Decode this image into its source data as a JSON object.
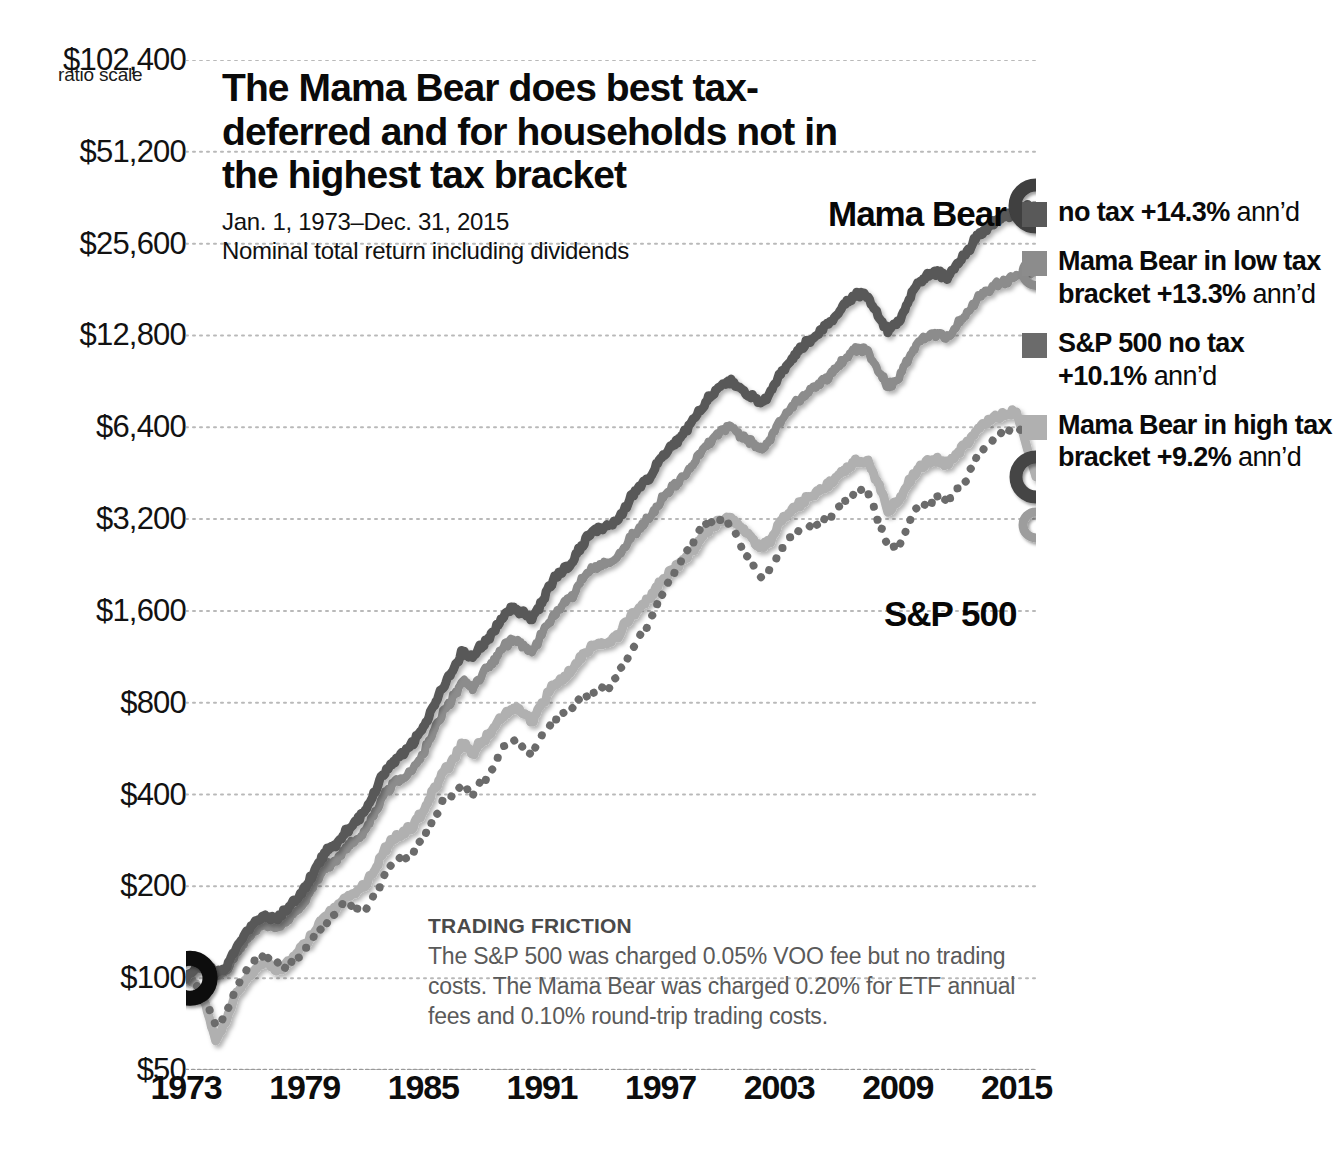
{
  "header": {
    "title": "The Mama Bear does best tax-deferred and for households not in the highest tax bracket",
    "date_range": "Jan. 1, 1973–Dec. 31, 2015",
    "subnote": "Nominal total return including dividends",
    "ratio_scale_label": "ratio scale"
  },
  "inline_labels": {
    "mama_bear": "Mama Bear",
    "sp500": "S&P 500"
  },
  "legend": [
    {
      "name": "no tax",
      "perf": "+14.3%",
      "annd": "ann’d",
      "color": "#595959"
    },
    {
      "name": "Mama Bear in low tax bracket",
      "perf": "+13.3%",
      "annd": "ann’d",
      "color": "#8c8c8c"
    },
    {
      "name": "S&P 500 no tax",
      "perf": "+10.1%",
      "annd": "ann’d",
      "color": "#6b6b6b"
    },
    {
      "name": "Mama Bear in high tax bracket",
      "perf": "+9.2%",
      "annd": "ann’d",
      "color": "#b0b0b0"
    }
  ],
  "trading_friction": {
    "heading": "TRADING FRICTION",
    "body": "The S&P 500 was charged 0.05% VOO fee but no trading costs. The Mama Bear was charged 0.20% for ETF annual fees and 0.10% round-trip trading costs."
  },
  "chart_data": {
    "type": "line",
    "title": "The Mama Bear does best tax-deferred and for households not in the highest tax bracket",
    "subtitle": "Jan. 1, 1973–Dec. 31, 2015 / Nominal total return including dividends",
    "xlabel": "",
    "ylabel": "ratio scale",
    "scale": "log2",
    "grid": true,
    "legend_position": "right",
    "xlim": [
      1973,
      2015.99
    ],
    "ylim": [
      50,
      102400
    ],
    "yticks": [
      102400,
      51200,
      25600,
      12800,
      6400,
      3200,
      1600,
      800,
      400,
      200,
      100,
      50
    ],
    "ytick_labels": [
      "$102,400",
      "$51,200",
      "$25,600",
      "$12,800",
      "$6,400",
      "$3,200",
      "$1,600",
      "$800",
      "$400",
      "$200",
      "$100",
      "$50"
    ],
    "xticks": [
      1973,
      1979,
      1985,
      1991,
      1997,
      2003,
      2009,
      2015
    ],
    "xtick_labels": [
      "1973",
      "1979",
      "1985",
      "1991",
      "1997",
      "2003",
      "2009",
      "2015"
    ],
    "annotations": [
      {
        "text": "Mama Bear",
        "x": 2008,
        "y": 60000
      },
      {
        "text": "S&P 500",
        "x": 2007.5,
        "y": 2100
      }
    ],
    "start_marker": {
      "x": 1973,
      "y": 100,
      "style": "black-ring"
    },
    "series": [
      {
        "name": "Mama Bear no tax",
        "annualized": 14.3,
        "color": "#595959",
        "style": "solid",
        "width": 9,
        "end_marker": "dark-ring-large",
        "x": [
          1973,
          1973.5,
          1974,
          1974.5,
          1975,
          1975.5,
          1976,
          1976.5,
          1977,
          1977.5,
          1978,
          1978.5,
          1979,
          1979.5,
          1980,
          1980.5,
          1981,
          1981.5,
          1982,
          1982.5,
          1983,
          1983.5,
          1984,
          1984.5,
          1985,
          1985.5,
          1986,
          1986.5,
          1987,
          1987.5,
          1988,
          1988.5,
          1989,
          1989.5,
          1990,
          1990.5,
          1991,
          1991.5,
          1992,
          1992.5,
          1993,
          1993.5,
          1994,
          1994.5,
          1995,
          1995.5,
          1996,
          1996.5,
          1997,
          1997.5,
          1998,
          1998.5,
          1999,
          1999.5,
          2000,
          2000.5,
          2001,
          2001.5,
          2002,
          2002.5,
          2003,
          2003.5,
          2004,
          2004.5,
          2005,
          2005.5,
          2006,
          2006.5,
          2007,
          2007.5,
          2008,
          2008.5,
          2009,
          2009.5,
          2010,
          2010.5,
          2011,
          2011.5,
          2012,
          2012.5,
          2013,
          2013.5,
          2014,
          2014.5,
          2015,
          2015.99
        ],
        "y": [
          100,
          108,
          112,
          104,
          108,
          124,
          140,
          152,
          160,
          156,
          165,
          178,
          196,
          225,
          258,
          272,
          300,
          322,
          348,
          400,
          470,
          512,
          540,
          590,
          660,
          780,
          900,
          1020,
          1180,
          1120,
          1240,
          1360,
          1520,
          1640,
          1580,
          1500,
          1720,
          1980,
          2160,
          2320,
          2620,
          2900,
          2980,
          3050,
          3300,
          3750,
          4100,
          4450,
          5000,
          5500,
          5900,
          6500,
          7300,
          8000,
          8700,
          9100,
          8600,
          8200,
          7700,
          8200,
          9600,
          10500,
          11500,
          12200,
          13000,
          13900,
          15200,
          16500,
          17600,
          17200,
          15000,
          13200,
          14000,
          16500,
          18800,
          20000,
          20500,
          19800,
          22000,
          24000,
          27000,
          29000,
          30500,
          31500,
          33000,
          34000
        ]
      },
      {
        "name": "Mama Bear in low tax bracket",
        "annualized": 13.3,
        "color": "#8c8c8c",
        "style": "solid",
        "width": 8,
        "end_marker": "gray-ring-small",
        "x": [
          1973,
          1973.5,
          1974,
          1974.5,
          1975,
          1975.5,
          1976,
          1976.5,
          1977,
          1977.5,
          1978,
          1978.5,
          1979,
          1979.5,
          1980,
          1980.5,
          1981,
          1981.5,
          1982,
          1982.5,
          1983,
          1983.5,
          1984,
          1984.5,
          1985,
          1985.5,
          1986,
          1986.5,
          1987,
          1987.5,
          1988,
          1988.5,
          1989,
          1989.5,
          1990,
          1990.5,
          1991,
          1991.5,
          1992,
          1992.5,
          1993,
          1993.5,
          1994,
          1994.5,
          1995,
          1995.5,
          1996,
          1996.5,
          1997,
          1997.5,
          1998,
          1998.5,
          1999,
          1999.5,
          2000,
          2000.5,
          2001,
          2001.5,
          2002,
          2002.5,
          2003,
          2003.5,
          2004,
          2004.5,
          2005,
          2005.5,
          2006,
          2006.5,
          2007,
          2007.5,
          2008,
          2008.5,
          2009,
          2009.5,
          2010,
          2010.5,
          2011,
          2011.5,
          2012,
          2012.5,
          2013,
          2013.5,
          2014,
          2014.5,
          2015,
          2015.99
        ],
        "y": [
          100,
          107,
          110,
          102,
          105,
          119,
          133,
          143,
          150,
          145,
          152,
          163,
          178,
          203,
          230,
          241,
          263,
          280,
          300,
          342,
          398,
          431,
          452,
          490,
          545,
          640,
          735,
          828,
          952,
          900,
          990,
          1080,
          1200,
          1290,
          1240,
          1175,
          1340,
          1530,
          1660,
          1775,
          1995,
          2200,
          2250,
          2295,
          2470,
          2790,
          3030,
          3275,
          3660,
          4010,
          4280,
          4690,
          5240,
          5710,
          6180,
          6440,
          6060,
          5760,
          5390,
          5710,
          6650,
          7240,
          7890,
          8330,
          8830,
          9400,
          10200,
          11000,
          11700,
          11400,
          9900,
          8680,
          9160,
          10700,
          12100,
          12800,
          13050,
          12550,
          13850,
          15050,
          16800,
          17950,
          18800,
          19300,
          20100,
          20600
        ]
      },
      {
        "name": "S&P 500 no tax",
        "annualized": 10.1,
        "color": "#6b6b6b",
        "style": "dotted",
        "width": 8,
        "end_marker": "none",
        "x": [
          1973,
          1973.5,
          1974,
          1974.5,
          1975,
          1975.5,
          1976,
          1976.5,
          1977,
          1977.5,
          1978,
          1978.5,
          1979,
          1979.5,
          1980,
          1980.5,
          1981,
          1981.5,
          1982,
          1982.5,
          1983,
          1983.5,
          1984,
          1984.5,
          1985,
          1985.5,
          1986,
          1986.5,
          1987,
          1987.5,
          1988,
          1988.5,
          1989,
          1989.5,
          1990,
          1990.5,
          1991,
          1991.5,
          1992,
          1992.5,
          1993,
          1993.5,
          1994,
          1994.5,
          1995,
          1995.5,
          1996,
          1996.5,
          1997,
          1997.5,
          1998,
          1998.5,
          1999,
          1999.5,
          2000,
          2000.5,
          2001,
          2001.5,
          2002,
          2002.5,
          2003,
          2003.5,
          2004,
          2004.5,
          2005,
          2005.5,
          2006,
          2006.5,
          2007,
          2007.5,
          2008,
          2008.5,
          2009,
          2009.5,
          2010,
          2010.5,
          2011,
          2011.5,
          2012,
          2012.5,
          2013,
          2013.5,
          2014,
          2014.5,
          2015,
          2015.99
        ],
        "y": [
          100,
          96,
          85,
          70,
          76,
          92,
          104,
          115,
          120,
          112,
          110,
          115,
          124,
          138,
          150,
          162,
          175,
          170,
          166,
          185,
          215,
          238,
          248,
          258,
          290,
          330,
          380,
          400,
          430,
          400,
          440,
          480,
          570,
          610,
          580,
          540,
          620,
          690,
          720,
          760,
          820,
          870,
          880,
          900,
          1030,
          1180,
          1350,
          1480,
          1780,
          2000,
          2340,
          2560,
          2960,
          3160,
          3160,
          3020,
          2660,
          2400,
          2070,
          2150,
          2480,
          2720,
          2930,
          3020,
          3120,
          3260,
          3560,
          3790,
          3950,
          3880,
          3180,
          2640,
          2540,
          3050,
          3500,
          3660,
          3740,
          3700,
          4060,
          4330,
          5200,
          5580,
          6050,
          6180,
          6280,
          6400
        ]
      },
      {
        "name": "Mama Bear in high tax bracket",
        "annualized": 9.2,
        "color": "#b0b0b0",
        "style": "solid",
        "width": 9,
        "end_marker": "dark-ring-small",
        "x": [
          1973,
          1973.5,
          1974,
          1974.5,
          1975,
          1975.5,
          1976,
          1976.5,
          1977,
          1977.5,
          1978,
          1978.5,
          1979,
          1979.5,
          1980,
          1980.5,
          1981,
          1981.5,
          1982,
          1982.5,
          1983,
          1983.5,
          1984,
          1984.5,
          1985,
          1985.5,
          1986,
          1986.5,
          1987,
          1987.5,
          1988,
          1988.5,
          1989,
          1989.5,
          1990,
          1990.5,
          1991,
          1991.5,
          1992,
          1992.5,
          1993,
          1993.5,
          1994,
          1994.5,
          1995,
          1995.5,
          1996,
          1996.5,
          1997,
          1997.5,
          1998,
          1998.5,
          1999,
          1999.5,
          2000,
          2000.5,
          2001,
          2001.5,
          2002,
          2002.5,
          2003,
          2003.5,
          2004,
          2004.5,
          2005,
          2005.5,
          2006,
          2006.5,
          2007,
          2007.5,
          2008,
          2008.5,
          2009,
          2009.5,
          2010,
          2010.5,
          2011,
          2011.5,
          2012,
          2012.5,
          2013,
          2013.5,
          2014,
          2014.5,
          2015,
          2015.99
        ],
        "y": [
          100,
          95,
          82,
          62,
          72,
          88,
          98,
          108,
          114,
          106,
          110,
          118,
          128,
          142,
          158,
          168,
          182,
          190,
          200,
          225,
          262,
          285,
          300,
          318,
          352,
          410,
          472,
          520,
          590,
          545,
          600,
          650,
          720,
          770,
          740,
          700,
          790,
          890,
          960,
          1020,
          1130,
          1230,
          1250,
          1270,
          1370,
          1530,
          1660,
          1780,
          1980,
          2150,
          2290,
          2480,
          2760,
          2980,
          3180,
          3250,
          3020,
          2820,
          2570,
          2700,
          3070,
          3330,
          3580,
          3760,
          3930,
          4140,
          4480,
          4760,
          5000,
          4900,
          4200,
          3450,
          3610,
          4180,
          4700,
          4930,
          5000,
          4820,
          5290,
          5700,
          6280,
          6650,
          6900,
          7050,
          7250,
          4400
        ]
      }
    ]
  }
}
